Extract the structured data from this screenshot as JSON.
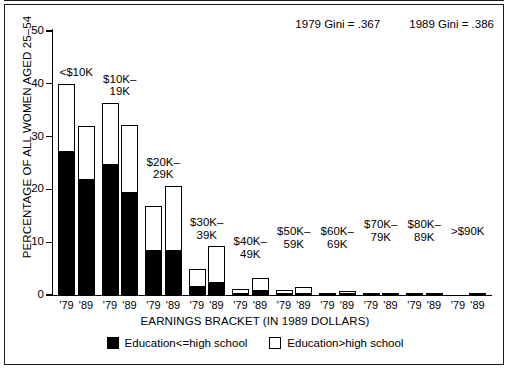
{
  "annotations": {
    "gini_1979": "1979 Gini = .367",
    "gini_1989": "1989 Gini = .386"
  },
  "legend": {
    "entries": [
      {
        "label": "Education<=high school",
        "swatch": "filled",
        "color": "#000000"
      },
      {
        "label": "Education>high school",
        "swatch": "hollow",
        "color": "#ffffff"
      }
    ]
  },
  "axes": {
    "y_title": "PERCENTAGE OF ALL WOMEN AGED 25–54",
    "x_title": "EARNINGS BRACKET (IN 1989 DOLLARS)",
    "y_ticks": [
      "0",
      "10",
      "20",
      "30",
      "40",
      "50"
    ],
    "year_ticks": [
      "'79",
      "'89"
    ]
  },
  "chart_data": {
    "type": "bar",
    "title": "",
    "subtitle": "",
    "xlabel": "EARNINGS BRACKET (IN 1989 DOLLARS)",
    "ylabel": "PERCENTAGE OF ALL WOMEN AGED 25-54",
    "ylim": [
      0,
      50
    ],
    "ytick_values": [
      0,
      10,
      20,
      30,
      40,
      50
    ],
    "grid": false,
    "legend_position": "bottom-center",
    "stacked": true,
    "categories": [
      "<$10K",
      "$10K–19K",
      "$20K–29K",
      "$30K–39K",
      "$40K–49K",
      "$50K–59K",
      "$60K–69K",
      "$70K–79K",
      "$80K–89K",
      ">$90K"
    ],
    "subgroups": [
      "'79",
      "'89"
    ],
    "series": [
      {
        "name": "Education<=high school",
        "color": "#000000",
        "values_1979": [
          27.2,
          24.8,
          8.6,
          1.8,
          0.4,
          0.2,
          0.1,
          0.05,
          0.0,
          0.0
        ],
        "values_1989": [
          22.0,
          19.6,
          8.6,
          2.4,
          0.9,
          0.3,
          0.2,
          0.1,
          0.05,
          0.0
        ]
      },
      {
        "name": "Education>high school",
        "color": "#ffffff",
        "values_1979": [
          12.8,
          11.6,
          8.3,
          3.2,
          0.8,
          0.7,
          0.3,
          0.15,
          0.05,
          0.0
        ],
        "values_1989": [
          10.0,
          12.6,
          12.1,
          6.8,
          2.4,
          1.3,
          0.6,
          0.3,
          0.15,
          0.05
        ]
      }
    ],
    "totals_1979": [
      40.0,
      36.4,
      16.9,
      5.0,
      1.2,
      0.9,
      0.4,
      0.2,
      0.05,
      0.0
    ],
    "totals_1989": [
      32.0,
      32.2,
      20.7,
      9.2,
      3.3,
      1.6,
      0.8,
      0.4,
      0.2,
      0.05
    ],
    "annotations": [
      "1979 Gini = .367",
      "1989 Gini = .386"
    ]
  },
  "bracket_labels": [
    {
      "text_line1": "<$10K",
      "text_line2": ""
    },
    {
      "text_line1": "$10K–",
      "text_line2": "19K"
    },
    {
      "text_line1": "$20K–",
      "text_line2": "29K"
    },
    {
      "text_line1": "$30K–",
      "text_line2": "39K"
    },
    {
      "text_line1": "$40K–",
      "text_line2": "49K"
    },
    {
      "text_line1": "$50K–",
      "text_line2": "59K"
    },
    {
      "text_line1": "$60K–",
      "text_line2": "69K"
    },
    {
      "text_line1": "$70K–",
      "text_line2": "79K"
    },
    {
      "text_line1": "$80K–",
      "text_line2": "89K"
    },
    {
      "text_line1": ">$90K",
      "text_line2": ""
    }
  ]
}
